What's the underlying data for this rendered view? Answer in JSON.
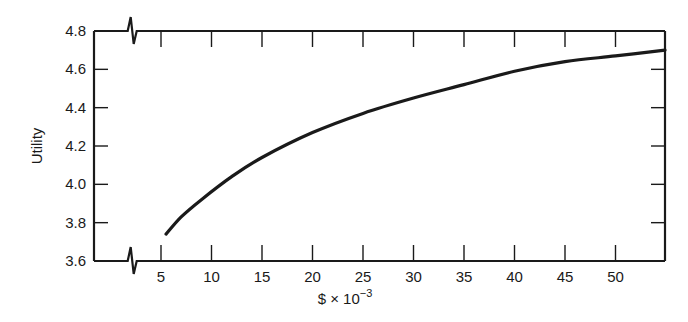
{
  "chart_data": {
    "type": "line",
    "title": "",
    "xlabel": "$ × 10",
    "xlabel_exponent": "−3",
    "ylabel": "Utility",
    "xlim": [
      0,
      55
    ],
    "ylim": [
      3.6,
      4.8
    ],
    "axis_break_x": true,
    "axis_break_y_position_x": 2,
    "grid": false,
    "legend": null,
    "x_ticks": [
      5,
      10,
      15,
      20,
      25,
      30,
      35,
      40,
      45,
      50
    ],
    "x_tick_labels": [
      "5",
      "10",
      "15",
      "20",
      "25",
      "30",
      "35",
      "40",
      "45",
      "50"
    ],
    "y_ticks": [
      3.6,
      3.8,
      4.0,
      4.2,
      4.4,
      4.6,
      4.8
    ],
    "y_tick_labels": [
      "3.6",
      "3.8",
      "4.0",
      "4.2",
      "4.4",
      "4.6",
      "4.8"
    ],
    "series": [
      {
        "name": "Utility",
        "x": [
          5.5,
          7,
          9,
          12,
          15,
          20,
          25,
          30,
          35,
          40,
          45,
          50,
          55
        ],
        "values": [
          3.74,
          3.83,
          3.92,
          4.04,
          4.14,
          4.27,
          4.37,
          4.45,
          4.52,
          4.59,
          4.64,
          4.67,
          4.7
        ]
      }
    ]
  }
}
